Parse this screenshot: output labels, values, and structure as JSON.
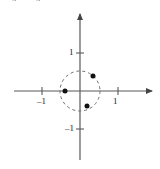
{
  "figure": {
    "kind": "coordinate-plane-unit-circle",
    "background_color": "#ffffff",
    "axis_color": "#595959",
    "circle_color": "#6e6e6e",
    "point_color": "#111111",
    "label_color": "#1a1a1a",
    "width": 160,
    "height": 169
  },
  "top_fragments": {
    "left": "4",
    "right": "4"
  },
  "axes": {
    "x_label": "",
    "y_label": "",
    "origin_px": {
      "x": 80,
      "y": 91
    },
    "x_axis": {
      "x1": 14,
      "x2": 152,
      "y": 91,
      "arrow": "right"
    },
    "y_axis": {
      "y1": 14,
      "y2": 160,
      "x": 80,
      "arrow": "up"
    },
    "unit_px": 38,
    "x_ticks": [
      {
        "value": -1,
        "label": "–1",
        "px": 42
      },
      {
        "value": 1,
        "label": "1",
        "px": 118
      }
    ],
    "y_ticks": [
      {
        "value": 1,
        "label": "1",
        "px": 53
      },
      {
        "value": -1,
        "label": "–1",
        "px": 129
      }
    ]
  },
  "unit_circle": {
    "center": {
      "x": 0,
      "y": 0
    },
    "radius": 1,
    "radius_px": 20,
    "style": "dashed",
    "dash_pattern": "3,3"
  },
  "chart_data": {
    "type": "scatter",
    "title": "",
    "xlabel": "",
    "ylabel": "",
    "xlim": [
      -1.75,
      1.9
    ],
    "ylim": [
      -1.85,
      2.05
    ],
    "grid": false,
    "legend": null,
    "annotations": [
      {
        "text": "dashed unit circle radius 1 centered at origin"
      }
    ],
    "series": [
      {
        "name": "points on unit circle",
        "marker": "filled-circle",
        "marker_size_px": 5,
        "color": "#111111",
        "points": [
          {
            "x": 0.65,
            "y": 0.75,
            "px": 93,
            "py": 76
          },
          {
            "x": -0.78,
            "y": 0.0,
            "px": 65,
            "py": 91
          },
          {
            "x": 0.35,
            "y": -0.75,
            "px": 87,
            "py": 106
          }
        ]
      }
    ]
  }
}
